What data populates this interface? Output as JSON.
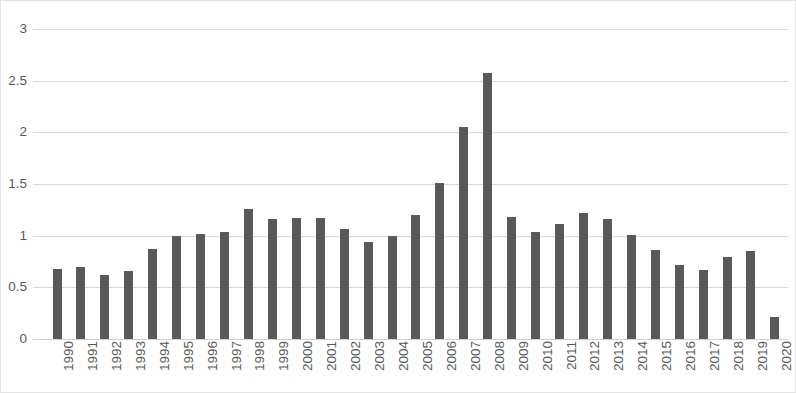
{
  "chart_data": {
    "type": "bar",
    "title": "",
    "subtitle": "",
    "xlabel": "",
    "ylabel": "",
    "categories": [
      "1990",
      "1991",
      "1992",
      "1993",
      "1994",
      "1995",
      "1996",
      "1997",
      "1998",
      "1999",
      "2000",
      "2001",
      "2002",
      "2003",
      "2004",
      "2005",
      "2006",
      "2007",
      "2008",
      "2009",
      "2010",
      "2011",
      "2012",
      "2013",
      "2014",
      "2015",
      "2016",
      "2017",
      "2018",
      "2019",
      "2020"
    ],
    "values": [
      0.68,
      0.7,
      0.62,
      0.66,
      0.87,
      1.0,
      1.02,
      1.04,
      1.26,
      1.16,
      1.17,
      1.17,
      1.06,
      0.94,
      1.0,
      1.2,
      1.51,
      2.05,
      2.57,
      1.18,
      1.04,
      1.11,
      1.22,
      1.16,
      1.01,
      0.86,
      0.72,
      0.67,
      0.79,
      0.85,
      0.21
    ],
    "ylim": [
      0,
      3
    ],
    "ytick_labels": [
      "0",
      "0.5",
      "1",
      "1.5",
      "2",
      "2.5",
      "3"
    ],
    "ytick_values": [
      0,
      0.5,
      1,
      1.5,
      2,
      2.5,
      3
    ],
    "grid": "horizontal",
    "legend": "none",
    "bar_color": "#595959",
    "gridline_color": "#d9d9d9",
    "axis_text_color": "#595959",
    "background_color": "#ffffff",
    "border_color": "#e3e3e3",
    "xtick_rotation": "-90"
  }
}
